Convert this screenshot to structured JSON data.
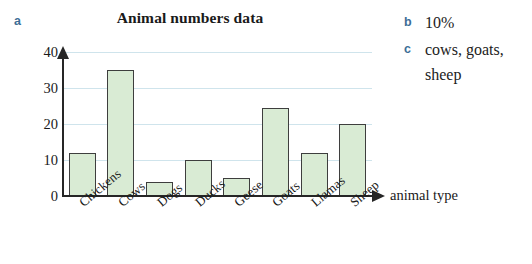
{
  "parts": {
    "a": "a",
    "b": "b",
    "c": "c"
  },
  "answers": {
    "b": "10%",
    "c_line1": "cows, goats,",
    "c_line2": "sheep"
  },
  "chart_data": {
    "type": "bar",
    "title": "Animal numbers data",
    "xlabel": "animal type",
    "ylabel": "",
    "ylim": [
      0,
      40
    ],
    "yticks": [
      0,
      10,
      20,
      30,
      40
    ],
    "ytick_labels": [
      "0",
      "10",
      "20",
      "30",
      "40"
    ],
    "grid": true,
    "grid_axis": "y",
    "legend": "none",
    "bar_fill_color": "#d9ebd4",
    "bar_edge_color": "#3e3e3e",
    "gridline_color": "#cfe4ec",
    "categories": [
      "Chickens",
      "Cows",
      "Dogs",
      "Ducks",
      "Geese",
      "Goats",
      "Llamas",
      "Sheep"
    ],
    "values": [
      12,
      35,
      4,
      10,
      5,
      24.5,
      12,
      20
    ]
  }
}
